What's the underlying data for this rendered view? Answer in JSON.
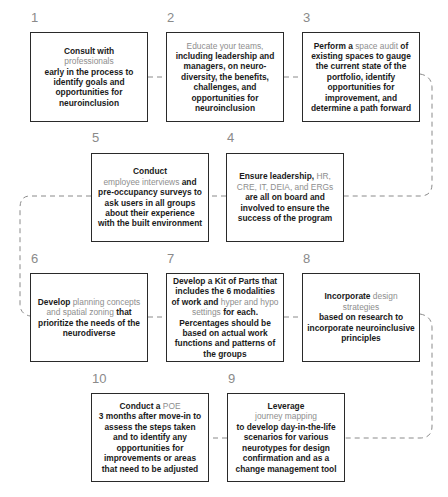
{
  "diagram": {
    "connector_color": "#8a8a8a",
    "number_color": "#8a8a8a",
    "highlight_color": "#8e8e8e",
    "text_color": "#1a1a1a",
    "border_color": "#2a2a2a"
  },
  "steps": [
    {
      "number": "1",
      "segments": [
        {
          "text": "Consult with",
          "highlight": false
        },
        {
          "text": "professionals",
          "highlight": true
        },
        {
          "text": "early in the process to identify goals and opportunities for neuroinclusion",
          "highlight": false
        }
      ]
    },
    {
      "number": "2",
      "segments": [
        {
          "text": "Educate your teams,",
          "highlight": true
        },
        {
          "text": "including leadership and managers, on neuro-diversity, the benefits, challenges, and opportunities for neuroinclusion",
          "highlight": false
        }
      ]
    },
    {
      "number": "3",
      "segments": [
        {
          "text": "Perform a",
          "highlight": false
        },
        {
          "text": "space audit",
          "highlight": true
        },
        {
          "text": "of existing spaces to gauge the current state of the portfolio, identify opportunities for improvement, and determine a path forward",
          "highlight": false
        }
      ]
    },
    {
      "number": "4",
      "segments": [
        {
          "text": "Ensure leadership,",
          "highlight": false
        },
        {
          "text": "HR, CRE, IT, DEIA, and ERGs",
          "highlight": true
        },
        {
          "text": "are all on board and involved to ensure the success of the program",
          "highlight": false
        }
      ]
    },
    {
      "number": "5",
      "segments": [
        {
          "text": "Conduct",
          "highlight": false
        },
        {
          "text": "employee interviews",
          "highlight": true
        },
        {
          "text": "and pre-occupancy surveys to ask users in all groups about their experience with the built environment",
          "highlight": false
        }
      ]
    },
    {
      "number": "6",
      "segments": [
        {
          "text": "Develop",
          "highlight": false
        },
        {
          "text": "planning concepts and spatial zoning",
          "highlight": true
        },
        {
          "text": "that prioritize the needs of the neurodiverse",
          "highlight": false
        }
      ]
    },
    {
      "number": "7",
      "segments": [
        {
          "text": "Develop a Kit of Parts that includes the 6 modalities of work and",
          "highlight": false
        },
        {
          "text": "hyper and hypo settings",
          "highlight": true
        },
        {
          "text": "for each. Percentages should be based on actual work functions and patterns of the groups",
          "highlight": false
        }
      ]
    },
    {
      "number": "8",
      "segments": [
        {
          "text": "Incorporate",
          "highlight": false
        },
        {
          "text": "design strategies",
          "highlight": true
        },
        {
          "text": "based on research to incorporate neuroinclusive principles",
          "highlight": false
        }
      ]
    },
    {
      "number": "9",
      "segments": [
        {
          "text": "Leverage",
          "highlight": false
        },
        {
          "text": "journey mapping",
          "highlight": true
        },
        {
          "text": "to develop day-in-the-life scenarios for various neurotypes for design confirmation and as a change management tool",
          "highlight": false
        }
      ]
    },
    {
      "number": "10",
      "segments": [
        {
          "text": "Conduct a",
          "highlight": false
        },
        {
          "text": "POE",
          "highlight": true
        },
        {
          "text": "3 months after move-in to assess the steps taken and to identify any opportunities for improvements or areas that need to be adjusted",
          "highlight": false
        }
      ]
    }
  ]
}
